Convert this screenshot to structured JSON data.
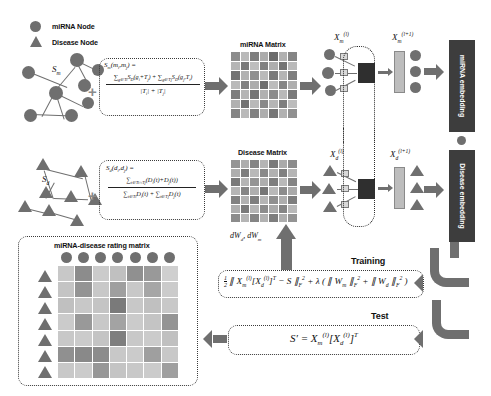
{
  "figure": {
    "legend": {
      "mirna_node": "miRNA Node",
      "disease_node": "Disease Node"
    },
    "graphs": {
      "mirna_similarity_symbol": "S",
      "mirna_similarity_sub": "m",
      "disease_similarity_symbol": "S",
      "disease_similarity_sub": "d",
      "plus_operator": "+"
    },
    "formulas": {
      "mirna_similarity": {
        "lhs": "S",
        "lhs_sub": "m",
        "args": "(mᵢ, mⱼ) =",
        "numerator": "∑ S (g , T ) + ∑ S (g , T )",
        "numerator_parts": [
          "∑",
          "g∈Tᵢ",
          "S",
          "D",
          "(gᵢ + Tⱼ)",
          "+",
          "∑",
          "g∈Tⱼ",
          "S",
          "D",
          "(gⱼ , Tᵢ)"
        ],
        "denominator": "|Tᵢ| + |Tⱼ|"
      },
      "disease_similarity": {
        "lhs": "S",
        "lhs_sub": "d",
        "args": "(dᵢ, dⱼ) =",
        "numerator": "∑ (Dᵢ(t) + Dⱼ(t))",
        "numerator_sub": "t∈Tᵢ∩Tⱼ",
        "denominator": "∑ Dᵢ(t) + ∑ Dⱼ(t)",
        "denominator_sub_left": "t∈Tᵢ",
        "denominator_sub_right": "t∈Tⱼ"
      },
      "training_loss": "½ ‖ Xₘ⁽ˡ⁾[X𝑑⁽ˡ⁾]ᵀ − S ‖²ₓ + λ ( ‖ Wₘ ‖²ₓ + ‖ W𝑑 ‖²ₓ )",
      "test_equation": "S′ = Xₘ⁽ˡ⁾[X𝑑⁽ˡ⁾]ᵀ"
    },
    "matrices": {
      "mirna_matrix_label": "miRNA Matrix",
      "disease_matrix_label": "Disease Matrix",
      "rating_matrix_label": "miRNA-disease rating matrix",
      "grid_size": 7
    },
    "layers": {
      "mirna_input_label_base": "X",
      "mirna_input_sub": "m",
      "mirna_input_sup": "(l)",
      "mirna_output_sup": "(l+1)",
      "disease_input_sub": "d",
      "disease_input_sup": "(l)",
      "disease_output_sup": "(l+1)",
      "weight_symbol": "W"
    },
    "embeddings": {
      "mirna": "miRNA embedding",
      "disease": "Disease embedding"
    },
    "flow": {
      "gradients": "dW𝑑 , dWₘ",
      "training": "Training",
      "test": "Test"
    },
    "colors": {
      "node_gray": "#6f6f6f",
      "embed_dark": "#3d3d3d",
      "arrow_gray": "#6f6f6f",
      "dash_border": "#3a3a3a",
      "net_dark": "#2f2f2f"
    },
    "chart_data": {
      "type": "heatmap",
      "title": "miRNA-disease rating matrix",
      "rows": 7,
      "cols": 7,
      "mirna_matrix_values": [
        [
          0.62,
          0.38,
          0.7,
          0.45,
          0.8,
          0.42,
          0.66
        ],
        [
          0.4,
          0.72,
          0.35,
          0.68,
          0.44,
          0.75,
          0.38
        ],
        [
          0.75,
          0.42,
          0.6,
          0.38,
          0.72,
          0.4,
          0.7
        ],
        [
          0.38,
          0.68,
          0.45,
          0.78,
          0.36,
          0.66,
          0.44
        ],
        [
          0.7,
          0.4,
          0.74,
          0.42,
          0.62,
          0.38,
          0.72
        ],
        [
          0.42,
          0.76,
          0.38,
          0.64,
          0.4,
          0.7,
          0.36
        ],
        [
          0.66,
          0.38,
          0.68,
          0.44,
          0.74,
          0.42,
          0.6
        ]
      ],
      "disease_matrix_values": [
        [
          0.58,
          0.44,
          0.66,
          0.4,
          0.72,
          0.46,
          0.62
        ],
        [
          0.44,
          0.7,
          0.38,
          0.64,
          0.42,
          0.68,
          0.4
        ],
        [
          0.72,
          0.4,
          0.58,
          0.44,
          0.7,
          0.38,
          0.66
        ],
        [
          0.4,
          0.66,
          0.44,
          0.74,
          0.38,
          0.62,
          0.46
        ],
        [
          0.68,
          0.42,
          0.7,
          0.4,
          0.6,
          0.44,
          0.7
        ],
        [
          0.44,
          0.72,
          0.4,
          0.62,
          0.46,
          0.66,
          0.38
        ],
        [
          0.62,
          0.4,
          0.66,
          0.42,
          0.7,
          0.44,
          0.58
        ]
      ],
      "rating_matrix_values": [
        [
          0.3,
          0.62,
          0.28,
          0.34,
          0.6,
          0.55,
          0.26
        ],
        [
          0.32,
          0.58,
          0.3,
          0.52,
          0.3,
          0.48,
          0.28
        ],
        [
          0.34,
          0.3,
          0.32,
          0.72,
          0.3,
          0.34,
          0.3
        ],
        [
          0.28,
          0.55,
          0.3,
          0.5,
          0.28,
          0.32,
          0.58
        ],
        [
          0.3,
          0.28,
          0.32,
          0.7,
          0.3,
          0.28,
          0.34
        ],
        [
          0.6,
          0.64,
          0.62,
          0.3,
          0.28,
          0.52,
          0.3
        ],
        [
          0.3,
          0.28,
          0.56,
          0.32,
          0.3,
          0.28,
          0.52
        ]
      ],
      "colormap": "grayscale",
      "legend_position": "none",
      "grid": true
    }
  }
}
